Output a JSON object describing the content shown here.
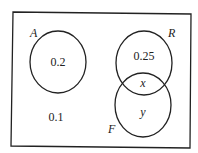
{
  "diagram": {
    "type": "venn",
    "sets": [
      {
        "name": "A",
        "value": "0.2"
      },
      {
        "name": "R",
        "value": "0.25"
      },
      {
        "name": "F",
        "value": "y"
      }
    ],
    "intersection_RF": "x",
    "outside": "0.1"
  }
}
